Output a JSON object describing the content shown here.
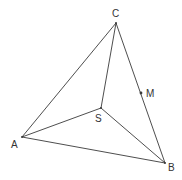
{
  "diagram": {
    "type": "tetrahedron",
    "line_color": "#3a3a3a",
    "points": {
      "A": {
        "label": "A",
        "x": 22,
        "y": 137,
        "lx": 11,
        "ly": 148
      },
      "B": {
        "label": "B",
        "x": 165,
        "y": 163,
        "lx": 168,
        "ly": 171
      },
      "C": {
        "label": "C",
        "x": 116,
        "y": 23,
        "lx": 112,
        "ly": 17
      },
      "S": {
        "label": "S",
        "x": 101,
        "y": 108,
        "lx": 95,
        "ly": 122
      },
      "M": {
        "label": "M",
        "x": 141,
        "y": 93,
        "lx": 146,
        "ly": 97
      }
    },
    "edges": [
      [
        "A",
        "B"
      ],
      [
        "A",
        "C"
      ],
      [
        "B",
        "C"
      ],
      [
        "S",
        "A"
      ],
      [
        "S",
        "B"
      ],
      [
        "S",
        "C"
      ]
    ]
  }
}
